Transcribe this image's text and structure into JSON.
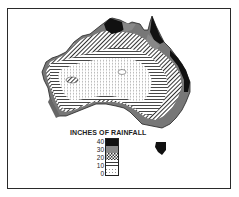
{
  "map": {
    "subject": "Australia annual rainfall",
    "style": "monochrome hatched choropleth",
    "colors": {
      "frame": "#2a2a2a",
      "ink": "#1a1a1a",
      "gray_band": "#8a8a8a",
      "paper": "#ffffff"
    }
  },
  "legend": {
    "title": "INCHES OF RAINFALL",
    "tick_labels": [
      "40",
      "30",
      "20",
      "10",
      "0"
    ],
    "bands": [
      {
        "range": "40+",
        "pattern": "solid-black"
      },
      {
        "range": "30-40",
        "pattern": "solid-gray"
      },
      {
        "range": "20-30",
        "pattern": "crosshatch"
      },
      {
        "range": "10-20",
        "pattern": "horizontal-lines"
      },
      {
        "range": "0-10",
        "pattern": "dotted"
      }
    ]
  }
}
